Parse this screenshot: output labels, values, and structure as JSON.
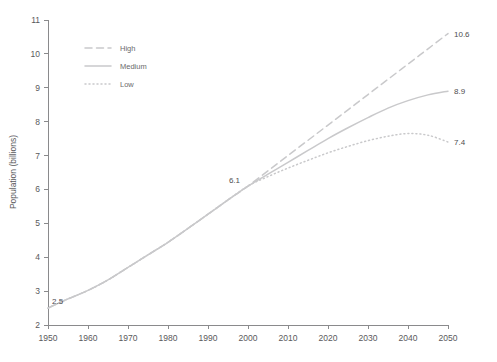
{
  "chart_data": {
    "type": "line",
    "title": "",
    "xlabel": "",
    "ylabel": "Population (billions)",
    "xlim": [
      1950,
      2050
    ],
    "ylim": [
      2,
      11
    ],
    "grid": false,
    "legend_position": "upper-left",
    "x_ticks": [
      1950,
      1960,
      1970,
      1980,
      1990,
      2000,
      2010,
      2020,
      2030,
      2040,
      2050
    ],
    "y_ticks": [
      2,
      3,
      4,
      5,
      6,
      7,
      8,
      9,
      10,
      11
    ],
    "annotations": [
      {
        "name": "start-value",
        "text": "2.5",
        "x": 1950,
        "y": 2.5
      },
      {
        "name": "divergence-value",
        "text": "6.1",
        "x": 2000,
        "y": 6.1
      },
      {
        "name": "high-end-value",
        "text": "10.6",
        "x": 2050,
        "y": 10.6
      },
      {
        "name": "medium-end-value",
        "text": "8.9",
        "x": 2050,
        "y": 8.9
      },
      {
        "name": "low-end-value",
        "text": "7.4",
        "x": 2050,
        "y": 7.4
      }
    ],
    "x": [
      1950,
      1955,
      1960,
      1965,
      1970,
      1975,
      1980,
      1985,
      1990,
      1995,
      2000,
      2005,
      2010,
      2015,
      2020,
      2025,
      2030,
      2035,
      2040,
      2045,
      2050
    ],
    "series": [
      {
        "name": "High",
        "style": "dashed",
        "color": "#c9c9cb",
        "values": [
          2.5,
          2.77,
          3.02,
          3.33,
          3.7,
          4.07,
          4.44,
          4.85,
          5.27,
          5.69,
          6.1,
          6.55,
          7.0,
          7.45,
          7.9,
          8.35,
          8.8,
          9.25,
          9.7,
          10.15,
          10.6
        ]
      },
      {
        "name": "Medium",
        "style": "solid",
        "color": "#c9c9cb",
        "values": [
          2.5,
          2.77,
          3.02,
          3.33,
          3.7,
          4.07,
          4.44,
          4.85,
          5.27,
          5.69,
          6.1,
          6.45,
          6.8,
          7.15,
          7.5,
          7.82,
          8.12,
          8.4,
          8.62,
          8.79,
          8.9
        ]
      },
      {
        "name": "Low",
        "style": "dotted",
        "color": "#c9c9cb",
        "values": [
          2.5,
          2.77,
          3.02,
          3.33,
          3.7,
          4.07,
          4.44,
          4.85,
          5.27,
          5.69,
          6.1,
          6.38,
          6.63,
          6.86,
          7.08,
          7.27,
          7.44,
          7.57,
          7.65,
          7.6,
          7.4
        ]
      }
    ]
  },
  "legend": {
    "items": [
      {
        "label": "High",
        "style": "dashed"
      },
      {
        "label": "Medium",
        "style": "solid"
      },
      {
        "label": "Low",
        "style": "dotted"
      }
    ]
  }
}
